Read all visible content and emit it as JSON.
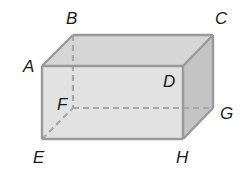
{
  "diagram": {
    "type": "rectangular-prism",
    "colors": {
      "background": "#ffffff",
      "front_face": "#e2e2e2",
      "top_face": "#d6d6d6",
      "side_face": "#c4c4c4",
      "edge": "#9a9a9a",
      "hidden_edge": "#a8a8a8",
      "label": "#1a1a1a"
    },
    "vertices": {
      "A": {
        "label": "A",
        "x": 42,
        "y": 66
      },
      "B": {
        "label": "B",
        "x": 73,
        "y": 35
      },
      "C": {
        "label": "C",
        "x": 213,
        "y": 35
      },
      "D": {
        "label": "D",
        "x": 183,
        "y": 66
      },
      "E": {
        "label": "E",
        "x": 42,
        "y": 139
      },
      "F": {
        "label": "F",
        "x": 73,
        "y": 108
      },
      "G": {
        "label": "G",
        "x": 213,
        "y": 108
      },
      "H": {
        "label": "H",
        "x": 183,
        "y": 139
      }
    },
    "labels": [
      {
        "text": "A",
        "x": 23,
        "y": 72
      },
      {
        "text": "B",
        "x": 66,
        "y": 24
      },
      {
        "text": "C",
        "x": 215,
        "y": 24
      },
      {
        "text": "D",
        "x": 163,
        "y": 87
      },
      {
        "text": "E",
        "x": 33,
        "y": 163
      },
      {
        "text": "F",
        "x": 57,
        "y": 110
      },
      {
        "text": "G",
        "x": 220,
        "y": 119
      },
      {
        "text": "H",
        "x": 176,
        "y": 163
      }
    ],
    "hidden_edges": [
      "BF",
      "EF",
      "FG"
    ]
  }
}
